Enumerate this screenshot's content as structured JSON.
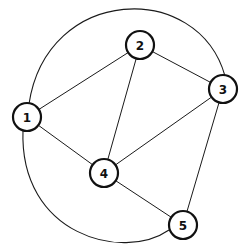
{
  "diagram": {
    "type": "undirected-graph",
    "colors": {
      "stroke": "#111111",
      "background": "#ffffff",
      "node_fill": "#ffffff"
    },
    "node_radius": 14,
    "nodes": [
      {
        "id": "1",
        "label": "1",
        "x": 27,
        "y": 117
      },
      {
        "id": "2",
        "label": "2",
        "x": 140,
        "y": 45
      },
      {
        "id": "3",
        "label": "3",
        "x": 223,
        "y": 89
      },
      {
        "id": "4",
        "label": "4",
        "x": 104,
        "y": 173
      },
      {
        "id": "5",
        "label": "5",
        "x": 183,
        "y": 225
      }
    ],
    "edges": [
      {
        "from": "1",
        "to": "2",
        "style": "straight"
      },
      {
        "from": "1",
        "to": "4",
        "style": "straight"
      },
      {
        "from": "2",
        "to": "3",
        "style": "straight"
      },
      {
        "from": "2",
        "to": "4",
        "style": "straight"
      },
      {
        "from": "3",
        "to": "4",
        "style": "straight"
      },
      {
        "from": "3",
        "to": "5",
        "style": "straight"
      },
      {
        "from": "4",
        "to": "5",
        "style": "straight"
      },
      {
        "from": "1",
        "to": "3",
        "style": "curved-top"
      },
      {
        "from": "1",
        "to": "5",
        "style": "curved-bottom"
      }
    ]
  }
}
